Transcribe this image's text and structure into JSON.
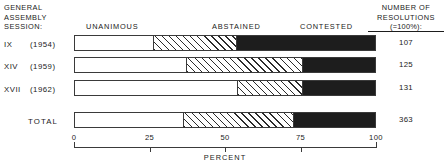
{
  "header": {
    "session_caption_lines": [
      "GENERAL",
      "ASSEMBLY",
      "SESSION:"
    ],
    "resolutions_title_lines": [
      "NUMBER OF",
      "RESOLUTIONS"
    ],
    "resolutions_basis_note": "(=100%):"
  },
  "legend": {
    "unanimous": "UNANIMOUS",
    "abstained": "ABSTAINED",
    "contested": "CONTESTED"
  },
  "rows": [
    {
      "roman": "IX",
      "year": "(1954)",
      "count": "107"
    },
    {
      "roman": "XIV",
      "year": "(1959)",
      "count": "125"
    },
    {
      "roman": "XVII",
      "year": "(1962)",
      "count": "131"
    }
  ],
  "total_row": {
    "label": "TOTAL",
    "count": "363"
  },
  "axis": {
    "title": "PERCENT",
    "tick_labels": [
      "0",
      "25",
      "50",
      "75",
      "100"
    ]
  },
  "colors": {
    "unanimous": "#ffffff",
    "abstained_hatch": "#2b2b2b",
    "contested": "#1d1d1d",
    "outline": "#3a3a3a",
    "text": "#1a1a1a"
  },
  "chart_data": {
    "type": "bar",
    "orientation": "horizontal",
    "stacked": true,
    "normalized_percent": true,
    "title": "",
    "subtitle": "",
    "xlabel": "PERCENT",
    "ylabel": "GENERAL ASSEMBLY SESSION:",
    "xlim": [
      0,
      100
    ],
    "xticks": [
      0,
      25,
      50,
      75,
      100
    ],
    "grid": false,
    "legend_position": "top-inline",
    "categories": [
      "IX (1954)",
      "XIV (1959)",
      "XVII (1962)",
      "TOTAL"
    ],
    "series": [
      {
        "name": "UNANIMOUS",
        "values": [
          26,
          37,
          54,
          36
        ]
      },
      {
        "name": "ABSTAINED",
        "values": [
          28,
          39,
          22,
          37
        ]
      },
      {
        "name": "CONTESTED",
        "values": [
          46,
          24,
          24,
          27
        ]
      }
    ],
    "annotations": {
      "number_of_resolutions": {
        "label": "NUMBER OF RESOLUTIONS (=100%):",
        "values": [
          107,
          125,
          131,
          363
        ]
      }
    }
  }
}
